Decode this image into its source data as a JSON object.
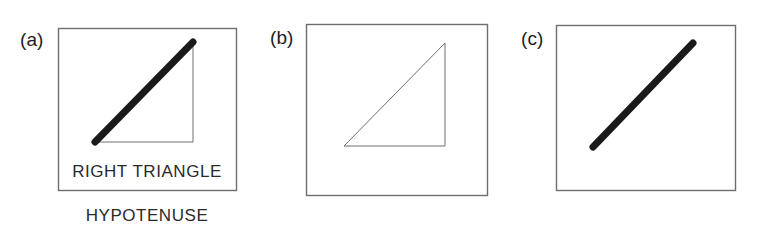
{
  "figure": {
    "background_color": "#ffffff",
    "box_stroke_color": "#6e6e6e",
    "thin_stroke_color": "#6e6e6e",
    "thick_stroke_color": "#1a1a1a",
    "text_color": "#2a2a2a",
    "label_color": "#1d1d1d",
    "panels": [
      {
        "id": "a",
        "label": "(a)",
        "box": {
          "x": 58,
          "y": 28,
          "width": 178,
          "height": 162
        },
        "triangle": {
          "vertex_bottom_left": {
            "x": 95,
            "y": 142
          },
          "vertex_apex": {
            "x": 193,
            "y": 42
          },
          "vertex_bottom_right": {
            "x": 193,
            "y": 142
          },
          "hypotenuse_style": "thick",
          "hypotenuse_width": 7,
          "leg_style": "thin",
          "leg_width": 1
        },
        "caption_inside": "RIGHT TRIANGLE",
        "caption_below": "HYPOTENUSE"
      },
      {
        "id": "b",
        "label": "(b)",
        "box": {
          "x": 46,
          "y": 24,
          "width": 181,
          "height": 171
        },
        "triangle": {
          "vertex_bottom_left": {
            "x": 84,
            "y": 146
          },
          "vertex_apex": {
            "x": 185,
            "y": 43
          },
          "vertex_bottom_right": {
            "x": 185,
            "y": 146
          },
          "hypotenuse_style": "thin",
          "hypotenuse_width": 1,
          "leg_style": "thin",
          "leg_width": 1
        },
        "caption_inside": "",
        "caption_below": ""
      },
      {
        "id": "c",
        "label": "(c)",
        "box": {
          "x": 46,
          "y": 25,
          "width": 179,
          "height": 165
        },
        "line": {
          "start": {
            "x": 83,
            "y": 147
          },
          "end": {
            "x": 183,
            "y": 43
          },
          "style": "thick",
          "width": 7
        },
        "caption_inside": "",
        "caption_below": ""
      }
    ]
  }
}
